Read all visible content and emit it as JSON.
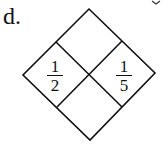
{
  "problem": {
    "label": "d."
  },
  "diamond": {
    "cells": {
      "top": "",
      "left": {
        "numerator": "1",
        "denominator": "2"
      },
      "right": {
        "numerator": "1",
        "denominator": "5"
      },
      "bottom": ""
    }
  },
  "colors": {
    "stroke": "#111111",
    "background": "#ffffff"
  }
}
